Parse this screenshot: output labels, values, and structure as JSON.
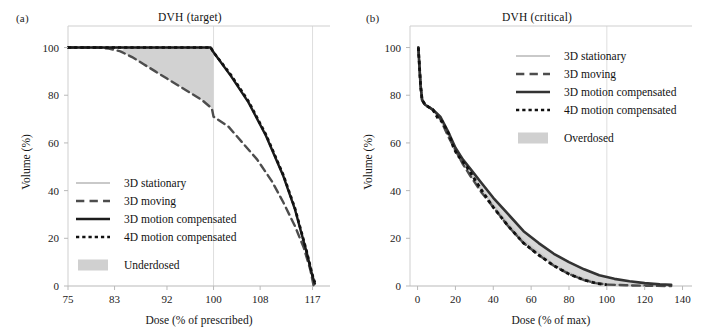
{
  "figure": {
    "panels": [
      {
        "tag": "(a)",
        "title": "DVH (target)"
      },
      {
        "tag": "(b)",
        "title": "DVH (critical)"
      }
    ]
  },
  "chart_data": [
    {
      "type": "line",
      "title": "DVH (target)",
      "panel": "(a)",
      "xlabel": "Dose (% of prescribed)",
      "ylabel": "Volume (%)",
      "xlim": [
        75,
        120
      ],
      "ylim": [
        0,
        104
      ],
      "xticks": [
        75,
        83,
        92,
        100,
        108,
        117
      ],
      "yticks": [
        0,
        20,
        40,
        60,
        80,
        100
      ],
      "grid": "vertical-light-at-100-and-117",
      "legend_position": "lower-left-inside",
      "shaded_region": {
        "label": "Underdosed",
        "color": "#d0d0d0",
        "between": [
          "3D moving",
          "3D motion compensated"
        ],
        "x_range": [
          83,
          100
        ]
      },
      "series": [
        {
          "name": "3D stationary",
          "style": "solid",
          "color": "#c9c9c9",
          "width": 2.2,
          "points": [
            [
              75,
              100
            ],
            [
              83,
              100
            ],
            [
              92,
              100
            ],
            [
              99.6,
              100
            ],
            [
              100,
              98
            ],
            [
              103,
              88
            ],
            [
              106,
              77
            ],
            [
              109,
              63
            ],
            [
              112,
              46
            ],
            [
              114,
              32
            ],
            [
              116,
              14
            ],
            [
              117,
              4
            ],
            [
              117.4,
              1
            ]
          ]
        },
        {
          "name": "3D moving",
          "style": "dashed",
          "color": "#4d4d4d",
          "width": 2.4,
          "points": [
            [
              75,
              100
            ],
            [
              80,
              100
            ],
            [
              82,
              99.6
            ],
            [
              84,
              98.4
            ],
            [
              86,
              96
            ],
            [
              88,
              93
            ],
            [
              90,
              90
            ],
            [
              92,
              87
            ],
            [
              94,
              84
            ],
            [
              96,
              81
            ],
            [
              98,
              78
            ],
            [
              99.7,
              74.5
            ],
            [
              100,
              71
            ],
            [
              102.5,
              67
            ],
            [
              105,
              60
            ],
            [
              107.5,
              53
            ],
            [
              110,
              44
            ],
            [
              112,
              35
            ],
            [
              114,
              25
            ],
            [
              115.5,
              16
            ],
            [
              116.6,
              7
            ],
            [
              117.2,
              0
            ]
          ]
        },
        {
          "name": "3D motion compensated",
          "style": "solid",
          "color": "#1c1c1c",
          "width": 2.4,
          "points": [
            [
              75,
              100
            ],
            [
              85,
              100
            ],
            [
              95,
              100
            ],
            [
              99.5,
              100
            ],
            [
              100,
              98
            ],
            [
              103,
              88
            ],
            [
              106,
              77
            ],
            [
              109,
              63
            ],
            [
              112,
              46
            ],
            [
              114,
              32
            ],
            [
              116,
              14
            ],
            [
              117,
              4
            ],
            [
              117.4,
              1
            ]
          ]
        },
        {
          "name": "4D motion compensated",
          "style": "dotted",
          "color": "#111111",
          "width": 2.6,
          "points": [
            [
              75,
              100
            ],
            [
              85,
              100
            ],
            [
              95,
              100
            ],
            [
              99.5,
              100
            ],
            [
              100,
              98
            ],
            [
              103,
              88.5
            ],
            [
              106,
              77.5
            ],
            [
              109,
              63.5
            ],
            [
              112,
              46.5
            ],
            [
              114,
              32.5
            ],
            [
              116,
              14.5
            ],
            [
              117,
              4.5
            ],
            [
              117.4,
              1.5
            ]
          ]
        }
      ]
    },
    {
      "type": "line",
      "title": "DVH (critical)",
      "panel": "(b)",
      "xlabel": "Dose (% of max)",
      "ylabel": "Volume (%)",
      "xlim": [
        -4,
        145
      ],
      "ylim": [
        0,
        104
      ],
      "xticks": [
        0,
        20,
        40,
        60,
        80,
        100,
        120,
        140
      ],
      "yticks": [
        0,
        20,
        40,
        60,
        80,
        100
      ],
      "grid": "vertical-light-at-100",
      "legend_position": "upper-right-inside",
      "shaded_region": {
        "label": "Overdosed",
        "color": "#d0d0d0",
        "between": [
          "4D motion compensated",
          "3D motion compensated"
        ],
        "x_range": [
          20,
          134
        ]
      },
      "series": [
        {
          "name": "3D stationary",
          "style": "solid",
          "color": "#c9c9c9",
          "width": 2.2,
          "points": [
            [
              0.4,
              100
            ],
            [
              1,
              92
            ],
            [
              1.6,
              84
            ],
            [
              2.4,
              78
            ],
            [
              4,
              76
            ],
            [
              8,
              74
            ],
            [
              12,
              70
            ],
            [
              16,
              64
            ],
            [
              20,
              57
            ],
            [
              24,
              52
            ],
            [
              28,
              47
            ],
            [
              34,
              40
            ],
            [
              40,
              34
            ],
            [
              48,
              26
            ],
            [
              56,
              19
            ],
            [
              64,
              14
            ],
            [
              72,
              9
            ],
            [
              80,
              5.5
            ],
            [
              88,
              3
            ],
            [
              94,
              1.5
            ],
            [
              100,
              0.8
            ],
            [
              110,
              0.4
            ],
            [
              120,
              0.2
            ],
            [
              134,
              0
            ]
          ]
        },
        {
          "name": "3D moving",
          "style": "dashed",
          "color": "#4d4d4d",
          "width": 2.4,
          "points": [
            [
              0.4,
              100
            ],
            [
              1,
              92
            ],
            [
              1.6,
              84
            ],
            [
              2.4,
              78
            ],
            [
              4,
              76
            ],
            [
              8,
              74
            ],
            [
              12,
              70
            ],
            [
              16,
              63
            ],
            [
              20,
              57
            ],
            [
              24,
              51
            ],
            [
              28,
              46
            ],
            [
              34,
              39
            ],
            [
              40,
              33
            ],
            [
              48,
              25
            ],
            [
              56,
              18
            ],
            [
              64,
              13
            ],
            [
              72,
              8.5
            ],
            [
              80,
              5
            ],
            [
              88,
              2.5
            ],
            [
              94,
              1.2
            ],
            [
              100,
              0.6
            ],
            [
              110,
              0.3
            ],
            [
              120,
              0.1
            ],
            [
              134,
              0
            ]
          ]
        },
        {
          "name": "3D motion compensated",
          "style": "solid",
          "color": "#333333",
          "width": 2.6,
          "points": [
            [
              0.4,
              100
            ],
            [
              1,
              92
            ],
            [
              1.6,
              84
            ],
            [
              2.4,
              78
            ],
            [
              4,
              76
            ],
            [
              8,
              74
            ],
            [
              12,
              71
            ],
            [
              16,
              65
            ],
            [
              20,
              58
            ],
            [
              24,
              53
            ],
            [
              28,
              49
            ],
            [
              34,
              43
            ],
            [
              40,
              37
            ],
            [
              48,
              30
            ],
            [
              56,
              23
            ],
            [
              64,
              18
            ],
            [
              72,
              13.5
            ],
            [
              80,
              10
            ],
            [
              88,
              7
            ],
            [
              96,
              4.5
            ],
            [
              104,
              3
            ],
            [
              112,
              2
            ],
            [
              120,
              1.2
            ],
            [
              128,
              0.7
            ],
            [
              134,
              0.5
            ]
          ]
        },
        {
          "name": "4D motion compensated",
          "style": "dotted",
          "color": "#111111",
          "width": 2.8,
          "points": [
            [
              0.4,
              100
            ],
            [
              1,
              92
            ],
            [
              1.6,
              84
            ],
            [
              2.4,
              78
            ],
            [
              4,
              76
            ],
            [
              8,
              74
            ],
            [
              11,
              70
            ],
            [
              13,
              69
            ],
            [
              15,
              66
            ],
            [
              17,
              63
            ],
            [
              19,
              58
            ],
            [
              21,
              55
            ],
            [
              23,
              53
            ],
            [
              26,
              50
            ],
            [
              30,
              45
            ],
            [
              34,
              40
            ],
            [
              40,
              33
            ],
            [
              48,
              25
            ],
            [
              56,
              18
            ],
            [
              64,
              13
            ],
            [
              72,
              8.5
            ],
            [
              80,
              5
            ],
            [
              88,
              2.5
            ],
            [
              94,
              1.2
            ],
            [
              100,
              0.5
            ]
          ]
        }
      ]
    }
  ],
  "legend": {
    "panel_a": {
      "entries": [
        {
          "label": "3D stationary",
          "style": "solid",
          "color": "#c9c9c9"
        },
        {
          "label": "3D moving",
          "style": "dashed",
          "color": "#4d4d4d"
        },
        {
          "label": "3D motion compensated",
          "style": "solid",
          "color": "#1c1c1c"
        },
        {
          "label": "4D motion compensated",
          "style": "dotted",
          "color": "#111111"
        }
      ],
      "patch": {
        "label": "Underdosed",
        "color": "#d0d0d0"
      }
    },
    "panel_b": {
      "entries": [
        {
          "label": "3D stationary",
          "style": "solid",
          "color": "#c9c9c9"
        },
        {
          "label": "3D moving",
          "style": "dashed",
          "color": "#4d4d4d"
        },
        {
          "label": "3D motion compensated",
          "style": "solid",
          "color": "#333333"
        },
        {
          "label": "4D motion compensated",
          "style": "dotted",
          "color": "#111111"
        }
      ],
      "patch": {
        "label": "Overdosed",
        "color": "#d0d0d0"
      }
    }
  },
  "axes": {
    "a": {
      "xlabel": "Dose (% of prescribed)",
      "ylabel": "Volume (%)",
      "xticks": [
        "75",
        "83",
        "92",
        "100",
        "108",
        "117"
      ],
      "yticks": [
        "0",
        "20",
        "40",
        "60",
        "80",
        "100"
      ]
    },
    "b": {
      "xlabel": "Dose (% of max)",
      "ylabel": "Volume (%)",
      "xticks": [
        "0",
        "20",
        "40",
        "60",
        "80",
        "100",
        "120",
        "140"
      ],
      "yticks": [
        "0",
        "20",
        "40",
        "60",
        "80",
        "100"
      ]
    }
  }
}
